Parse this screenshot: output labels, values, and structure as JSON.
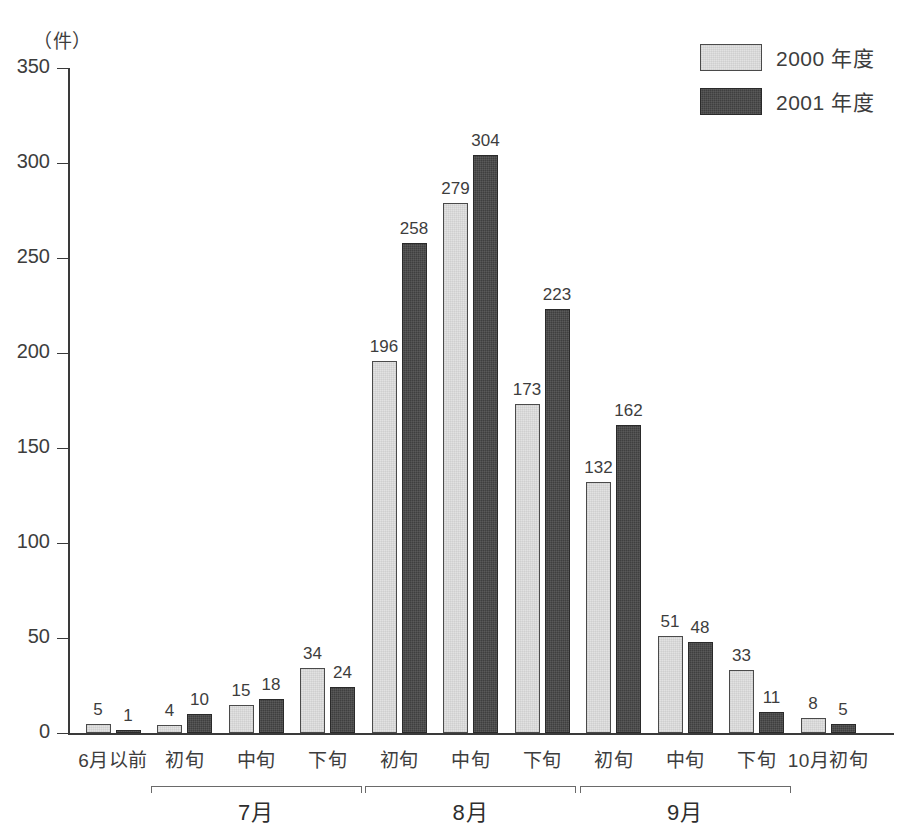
{
  "chart_data": {
    "type": "bar",
    "title": "",
    "xlabel": "",
    "ylabel": "（件）",
    "ylim": [
      0,
      350
    ],
    "yticks": [
      0,
      50,
      100,
      150,
      200,
      250,
      300,
      350
    ],
    "grid": false,
    "legend_position": "top-right",
    "categories": [
      "6月以前",
      "初旬",
      "中旬",
      "下旬",
      "初旬",
      "中旬",
      "下旬",
      "初旬",
      "中旬",
      "下旬",
      "10月初旬"
    ],
    "groups": [
      {
        "label": "7月",
        "start_index": 1,
        "end_index": 3
      },
      {
        "label": "8月",
        "start_index": 4,
        "end_index": 6
      },
      {
        "label": "9月",
        "start_index": 7,
        "end_index": 9
      }
    ],
    "series": [
      {
        "name": "2000 年度",
        "color": "#e2e2e2",
        "values": [
          5,
          4,
          15,
          34,
          196,
          279,
          173,
          132,
          51,
          33,
          8
        ]
      },
      {
        "name": "2001 年度",
        "color": "#3f3f3f",
        "values": [
          1,
          10,
          18,
          24,
          258,
          304,
          223,
          162,
          48,
          11,
          5
        ]
      }
    ]
  },
  "legend": {
    "items": [
      {
        "label": "2000 年度",
        "series": "s2000"
      },
      {
        "label": "2001 年度",
        "series": "s2001"
      }
    ]
  },
  "axis": {
    "unit": "（件）"
  }
}
